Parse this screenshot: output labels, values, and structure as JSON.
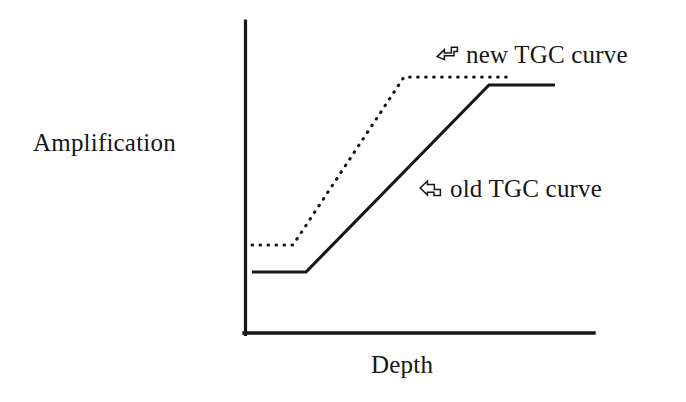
{
  "figure": {
    "background_color": "#ffffff",
    "ink_color": "#161616"
  },
  "axes": {
    "y_axis_title": "Amplification",
    "x_axis_title": "Depth",
    "y_axis": {
      "x": 245,
      "y_top": 21,
      "y_bottom": 334
    },
    "x_axis": {
      "y": 334,
      "x_left": 245,
      "x_right": 594
    },
    "ticks": [],
    "grid": false
  },
  "annotations": [
    {
      "id": "new",
      "label": "new TGC curve",
      "pointer_icon": "bent-arrow-pointer-icon",
      "pointer_x": 435,
      "pointer_y": 42,
      "label_x": 466,
      "label_y": 42
    },
    {
      "id": "old",
      "label": "old TGC curve",
      "pointer_icon": "bent-arrow-pointer-icon",
      "pointer_x": 418,
      "pointer_y": 176,
      "label_x": 450,
      "label_y": 176
    }
  ],
  "chart_data": {
    "type": "line",
    "title": "",
    "subtitle": "",
    "xlabel": "Depth",
    "ylabel": "Amplification",
    "xlim": [
      0,
      1
    ],
    "ylim": [
      0,
      1
    ],
    "grid": false,
    "legend_position": "inline-annotation",
    "axis_has_tick_labels": false,
    "series": [
      {
        "name": "old TGC curve",
        "style": "solid",
        "color": "#161616",
        "line_width": 3,
        "points_px": [
          [
            252,
            272
          ],
          [
            306,
            272
          ],
          [
            489,
            85
          ],
          [
            555,
            85
          ]
        ],
        "points_normalized": [
          [
            0.02,
            0.198
          ],
          [
            0.175,
            0.198
          ],
          [
            0.699,
            0.795
          ],
          [
            0.888,
            0.795
          ]
        ],
        "description": "Flat low gain near field, then linear ramp, then flat high plateau"
      },
      {
        "name": "new TGC curve",
        "style": "dotted",
        "color": "#161616",
        "line_width": 3,
        "points_px": [
          [
            252,
            245
          ],
          [
            293,
            245
          ],
          [
            404,
            77
          ],
          [
            512,
            77
          ]
        ],
        "points_normalized": [
          [
            0.02,
            0.284
          ],
          [
            0.137,
            0.284
          ],
          [
            0.455,
            0.821
          ],
          [
            0.765,
            0.821
          ]
        ],
        "description": "Higher starting gain, earlier and steeper ramp, reaches plateau sooner"
      }
    ],
    "annotations": [
      {
        "text": "new TGC curve",
        "target_series": "new TGC curve"
      },
      {
        "text": "old TGC curve",
        "target_series": "old TGC curve"
      }
    ]
  }
}
